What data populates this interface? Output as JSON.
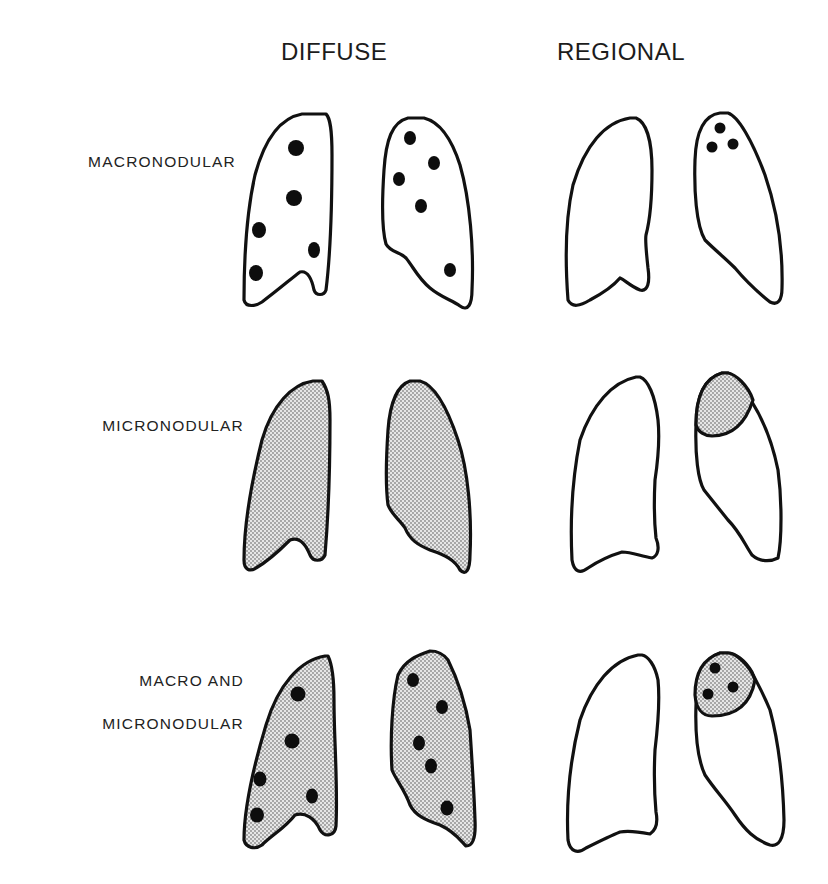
{
  "figure": {
    "columns": [
      {
        "id": "diffuse",
        "label": "DIFFUSE"
      },
      {
        "id": "regional",
        "label": "REGIONAL"
      }
    ],
    "rows": [
      {
        "id": "macronodular",
        "label_lines": [
          "MACRONODULAR"
        ]
      },
      {
        "id": "micronodular",
        "label_lines": [
          "MICRONODULAR"
        ]
      },
      {
        "id": "macro-and-micronodular",
        "label_lines": [
          "MACRO AND",
          "MICRONODULAR"
        ]
      }
    ],
    "panels": [
      {
        "row": "macronodular",
        "column": "diffuse",
        "fill": "none",
        "nodules": "scattered both lungs (6 right, 6 left)"
      },
      {
        "row": "macronodular",
        "column": "regional",
        "fill": "none",
        "nodules": "3 in left upper lobe apex"
      },
      {
        "row": "micronodular",
        "column": "diffuse",
        "fill": "stippled both lungs",
        "nodules": "none"
      },
      {
        "row": "micronodular",
        "column": "regional",
        "fill": "stippled left apex region",
        "nodules": "none"
      },
      {
        "row": "macro-and-micronodular",
        "column": "diffuse",
        "fill": "stippled both lungs",
        "nodules": "scattered both lungs (6 right, 6 left)"
      },
      {
        "row": "macro-and-micronodular",
        "column": "regional",
        "fill": "stippled left apex region",
        "nodules": "3 within stippled apex"
      }
    ],
    "colors": {
      "outline": "#111111",
      "nodule": "#0d0d0d",
      "stipple": "#9a9a9a",
      "background": "#ffffff"
    }
  }
}
